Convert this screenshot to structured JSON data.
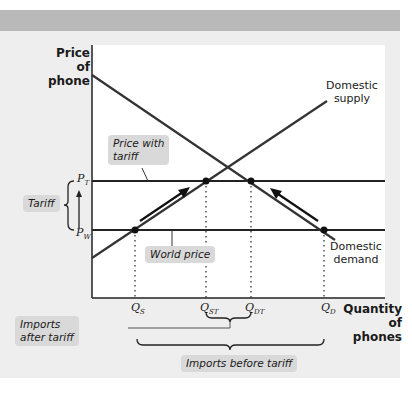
{
  "diagram": {
    "y_axis_label": [
      "Price of",
      "phone"
    ],
    "x_axis_label": [
      "Quantity",
      "of phones"
    ],
    "curves": {
      "supply_label": [
        "Domestic",
        "supply"
      ],
      "demand_label": [
        "Domestic",
        "demand"
      ]
    },
    "price_levels": {
      "pt": {
        "letter": "P",
        "sub": "T"
      },
      "pw": {
        "letter": "P",
        "sub": "W"
      }
    },
    "quantities": {
      "qs": {
        "letter": "Q",
        "sub": "S"
      },
      "qst": {
        "letter": "Q",
        "sub": "ST"
      },
      "qdt": {
        "letter": "Q",
        "sub": "DT"
      },
      "qd": {
        "letter": "Q",
        "sub": "D"
      }
    },
    "callouts": {
      "price_with_tariff": [
        "Price with",
        "tariff"
      ],
      "world_price": "World price",
      "tariff": "Tariff",
      "imports_after_tariff": [
        "Imports",
        "after tariff"
      ],
      "imports_before_tariff": "Imports before tariff"
    },
    "colors": {
      "line": "#222222",
      "callout_bg": "#d9d9d9",
      "panel_bg": "#eeeeee",
      "header_band": "#b9b9b9"
    }
  }
}
